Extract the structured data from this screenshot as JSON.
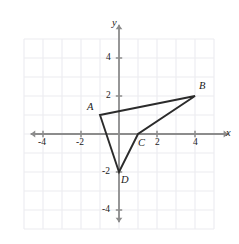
{
  "figure": {
    "type": "coordinate-plane-polygon",
    "background_color": "#ffffff",
    "grid_color": "#ebebf0",
    "axis_color": "#8c8c8c",
    "polygon_color": "#2b2b2b",
    "text_color": "#1a1a1a"
  },
  "axes": {
    "x_label": "x",
    "y_label": "y",
    "origin_px": {
      "x": 119,
      "y": 134
    },
    "unit_px": 19,
    "x_range": [
      -5.2,
      5.2
    ],
    "y_range": [
      -5.2,
      5.2
    ],
    "grid_visible": true,
    "grid_step": 1,
    "arrowheads": [
      "left",
      "right",
      "up",
      "down"
    ]
  },
  "x_ticks": [
    {
      "value": -4,
      "label": "-4"
    },
    {
      "value": -2,
      "label": "-2"
    },
    {
      "value": 2,
      "label": "2"
    },
    {
      "value": 4,
      "label": "4"
    }
  ],
  "y_ticks": [
    {
      "value": 4,
      "label": "4"
    },
    {
      "value": 2,
      "label": "2"
    },
    {
      "value": -2,
      "label": "-2"
    },
    {
      "value": -4,
      "label": "-4"
    }
  ],
  "polygon": {
    "name": "ABCD",
    "closed": true,
    "vertices": [
      {
        "label": "A",
        "x": -1,
        "y": 1,
        "label_dx": -13,
        "label_dy": -13
      },
      {
        "label": "B",
        "x": 4,
        "y": 2,
        "label_dx": 4,
        "label_dy": -15
      },
      {
        "label": "C",
        "x": 1,
        "y": 0,
        "label_dx": 0,
        "label_dy": 4
      },
      {
        "label": "D",
        "x": 0,
        "y": -2,
        "label_dx": 2,
        "label_dy": 3
      }
    ]
  },
  "chart_data": {
    "type": "scatter",
    "title": "",
    "xlabel": "x",
    "ylabel": "y",
    "xlim": [
      -5.2,
      5.2
    ],
    "ylim": [
      -5.2,
      5.2
    ],
    "grid": true,
    "series": [
      {
        "name": "Quadrilateral ABCD",
        "point_labels": [
          "A",
          "B",
          "C",
          "D"
        ],
        "x": [
          -1,
          4,
          1,
          0
        ],
        "y": [
          1,
          2,
          0,
          -2
        ],
        "closed_path": true
      }
    ]
  }
}
